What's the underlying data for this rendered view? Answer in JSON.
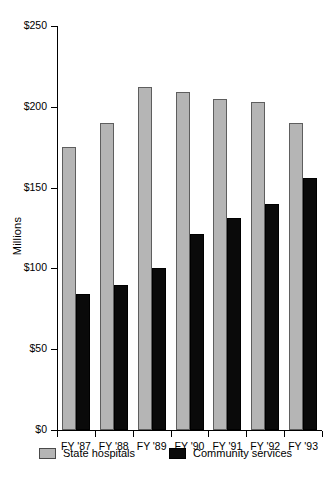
{
  "chart_data": {
    "type": "bar",
    "title": "",
    "xlabel": "",
    "ylabel": "Millions",
    "ylim": [
      0,
      250
    ],
    "ytick_values": [
      0,
      50,
      100,
      150,
      200,
      250
    ],
    "ytick_labels": [
      "$0",
      "$50",
      "$100",
      "$150",
      "$200",
      "$250"
    ],
    "grid": false,
    "legend_position": "bottom",
    "categories": [
      "FY '87",
      "FY '88",
      "FY '89",
      "FY '90",
      "FY '91",
      "FY '92",
      "FY '93"
    ],
    "series": [
      {
        "name": "State hospitals",
        "color": "#b5b5b5",
        "values": [
          175,
          190,
          212,
          209,
          205,
          203,
          190
        ]
      },
      {
        "name": "Community services",
        "color": "#0a0a0a",
        "values": [
          84,
          90,
          100,
          121,
          131,
          140,
          156
        ]
      }
    ]
  }
}
